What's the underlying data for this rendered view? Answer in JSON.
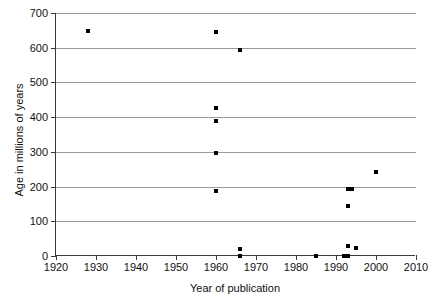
{
  "chart_data": {
    "type": "scatter",
    "title": "",
    "xlabel": "Year of publication",
    "ylabel": "Age in millions of years",
    "xlim": [
      1920,
      2010
    ],
    "ylim": [
      0,
      700
    ],
    "xticks": [
      1920,
      1930,
      1940,
      1950,
      1960,
      1970,
      1980,
      1990,
      2000,
      2010
    ],
    "yticks": [
      0,
      100,
      200,
      300,
      400,
      500,
      600,
      700
    ],
    "grid": "horizontal",
    "legend": "none",
    "marker": "square",
    "marker_color": "#000000",
    "points": [
      {
        "x": 1928,
        "y": 648
      },
      {
        "x": 1960,
        "y": 645
      },
      {
        "x": 1966,
        "y": 594
      },
      {
        "x": 1960,
        "y": 425
      },
      {
        "x": 1960,
        "y": 388
      },
      {
        "x": 1960,
        "y": 297
      },
      {
        "x": 2000,
        "y": 242
      },
      {
        "x": 1960,
        "y": 187
      },
      {
        "x": 1993,
        "y": 194
      },
      {
        "x": 1994,
        "y": 193
      },
      {
        "x": 1993,
        "y": 143
      },
      {
        "x": 1966,
        "y": 20
      },
      {
        "x": 1966,
        "y": 0
      },
      {
        "x": 1985,
        "y": 0
      },
      {
        "x": 1993,
        "y": 30
      },
      {
        "x": 1995,
        "y": 22
      },
      {
        "x": 1992,
        "y": 0
      },
      {
        "x": 1993,
        "y": 0
      }
    ]
  }
}
